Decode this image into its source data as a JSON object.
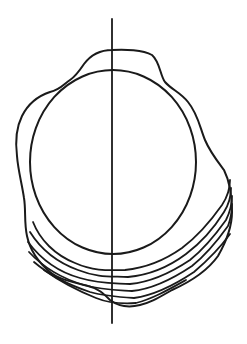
{
  "diagram": {
    "width": 247,
    "height": 344,
    "background": "#ffffff",
    "stroke_color": "#1a1a1a",
    "axis": {
      "x": 112,
      "y1": 19,
      "y2": 323,
      "stroke_width": 1.8
    },
    "circle": {
      "cx": 113,
      "cy": 162,
      "rx": 83,
      "ry": 92,
      "stroke_width": 2
    },
    "outer_outline": {
      "stroke_width": 2,
      "d": "M112,50 C125,49 143,50 152,55 C160,62 160,75 165,82 C172,90 180,92 188,102 C198,114 200,128 205,140 C210,152 218,162 224,170 C230,182 232,198 232,212 C232,228 226,242 218,256 C208,270 190,282 172,290 C158,298 150,303 140,305 C128,308 118,306 110,300 C104,294 98,288 88,286 C72,282 58,279 50,272 C38,262 30,250 27,236 C24,222 26,210 24,198 C22,184 18,170 17,156 C15,140 16,128 22,116 C28,104 38,96 50,92 C60,90 64,84 70,80 C76,76 80,70 84,64 C90,56 100,50 112,50 Z"
    },
    "growth_lines": [
      {
        "d": "M33,222 C40,240 55,255 75,263 C95,272 112,270 125,270 C145,268 165,260 182,248 C198,236 210,222 222,205 C228,196 230,188 230,180",
        "stroke_width": 1.8
      },
      {
        "d": "M30,232 C40,248 56,262 78,270 C98,278 112,276 128,277 C150,275 170,266 186,254 C202,242 214,228 224,212 C229,204 231,196 231,188",
        "stroke_width": 1.8
      },
      {
        "d": "M28,242 C40,258 58,272 80,278 C100,284 114,283 130,284 C152,282 172,272 190,260 C205,248 216,234 226,220 C230,212 232,204 232,196",
        "stroke_width": 1.8
      },
      {
        "d": "M29,252 C42,266 60,278 84,285 C102,290 116,290 132,291 C154,289 174,278 192,266 C207,254 218,240 228,226 C231,218 232,212 232,204",
        "stroke_width": 1.8
      },
      {
        "d": "M34,262 C48,274 66,284 90,292 C104,296 118,297 134,298 C156,295 176,284 194,272 C208,260 220,248 230,234",
        "stroke_width": 1.8
      },
      {
        "d": "M44,270 C58,280 76,290 96,298 C108,303 120,304 136,303 C152,299 168,290 186,280",
        "stroke_width": 1.8
      }
    ]
  }
}
